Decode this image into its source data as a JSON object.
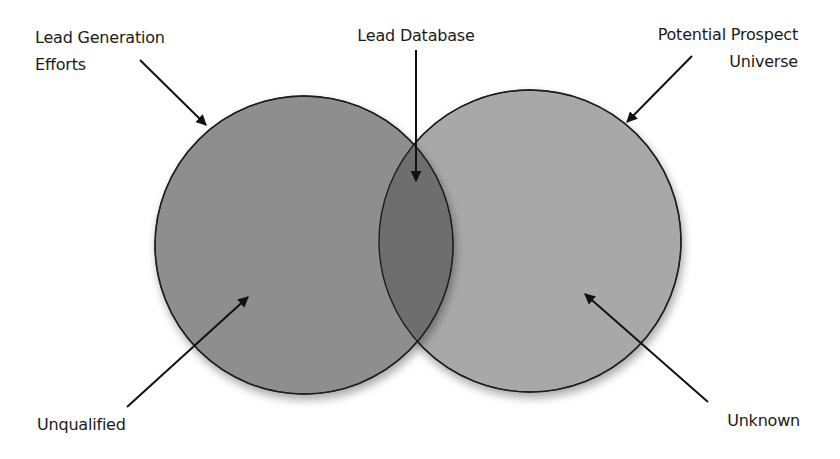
{
  "diagram": {
    "type": "venn",
    "colors": {
      "background": "#ffffff",
      "left_circle_fill": "#8e8e8e",
      "right_circle_fill": "#a8a8a8",
      "overlap_fill": "#6e6e6e",
      "outline": "#1e1e1e",
      "arrow": "#111111",
      "text": "#1a1a1a"
    },
    "sets": [
      {
        "id": "lead-generation-efforts",
        "label_lines": [
          "Lead Generation",
          "Efforts"
        ],
        "region_label": "Unqualified"
      },
      {
        "id": "potential-prospect-universe",
        "label_lines": [
          "Potential Prospect",
          "Universe"
        ],
        "region_label": "Unknown"
      }
    ],
    "intersection": {
      "label": "Lead Database"
    }
  },
  "labels": {
    "lead_generation_line1": "Lead Generation",
    "lead_generation_line2": "Efforts",
    "lead_database": "Lead Database",
    "potential_prospect_line1": "Potential Prospect",
    "potential_prospect_line2": "Universe",
    "unqualified": "Unqualified",
    "unknown": "Unknown"
  }
}
